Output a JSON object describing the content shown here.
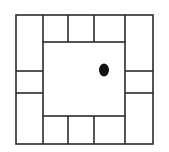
{
  "diagram": {
    "title": "",
    "colors": {
      "line": "#2b2b2b",
      "background": "#ffffff",
      "dot": "#111111"
    },
    "outer": {
      "x": 16,
      "y": 15,
      "w": 137,
      "h": 129
    },
    "top_row_dividers_x": [
      43,
      68,
      94,
      125
    ],
    "bottom_row_dividers_x": [
      43,
      68,
      94,
      125
    ],
    "inner": {
      "x": 43,
      "y": 42,
      "w": 82,
      "h": 74
    },
    "left_col_dividers_y": [
      71,
      93
    ],
    "right_col_dividers_y": [
      71,
      93
    ],
    "dot": {
      "cx": 104,
      "cy": 70,
      "rx": 5,
      "ry": 6.5
    }
  }
}
